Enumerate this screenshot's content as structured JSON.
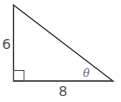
{
  "diagram": {
    "type": "right-triangle",
    "stroke_color": "#333333",
    "label_color": "#555555",
    "vertices": {
      "top": [
        13.5,
        5
      ],
      "right_angle": [
        13.5,
        81
      ],
      "bottom_right": [
        113,
        81
      ]
    },
    "right_angle_marker": {
      "x": 13.5,
      "y": 70.5,
      "size": 10.5
    },
    "labels": {
      "vertical_leg": "6",
      "horizontal_leg": "8",
      "angle": "θ"
    }
  }
}
